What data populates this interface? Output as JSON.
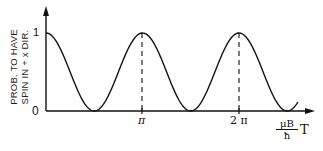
{
  "chart_data": {
    "type": "line",
    "title": "",
    "ylabel": "PROB. TO HAVE SPIN IN +x DIR.",
    "ylabel_lines": [
      "PROB. TO HAVE",
      "SPIN IN + x DIR."
    ],
    "xlabel_fraction": {
      "numerator": "μB",
      "denominator": "ħ"
    },
    "xlabel_suffix": "T",
    "xlabel": "(μB/ħ) T",
    "y_ticks": [
      "0",
      "1"
    ],
    "x_ticks": [
      "π",
      "2π"
    ],
    "ylim": [
      0,
      1
    ],
    "xlim": [
      0,
      2.6
    ],
    "function": "cos^2(x)",
    "x": [
      0,
      0.785,
      1.571,
      2.356,
      3.142,
      3.927,
      4.712,
      5.498,
      6.283,
      7.069,
      7.854,
      8.2
    ],
    "values": [
      1,
      0.5,
      0,
      0.5,
      1,
      0.5,
      0,
      0.5,
      1,
      0.5,
      0,
      0.13
    ],
    "annotations": [
      "dashed vertical line at π to peak",
      "dashed vertical line at 2π to peak"
    ],
    "grid": false,
    "legend": null
  },
  "axes": {
    "y_tick_top": "1",
    "y_tick_origin": "0",
    "x_tick_pi": "π",
    "x_tick_2pi": "2 π",
    "x_label_num": "μB",
    "x_label_den": "ħ",
    "x_label_T": "T",
    "y_label_line1": "PROB. TO HAVE",
    "y_label_line2": "SPIN IN + x DIR."
  }
}
